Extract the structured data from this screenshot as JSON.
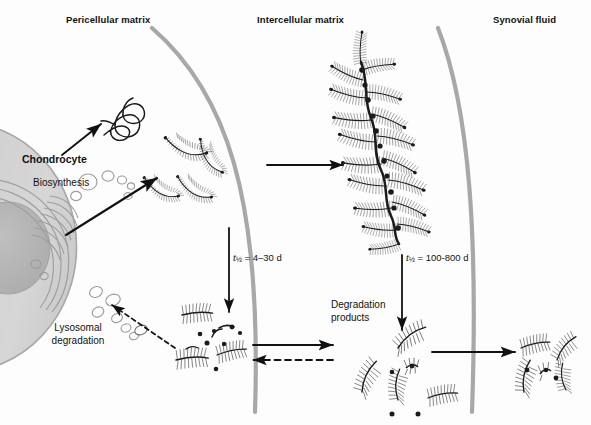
{
  "figure": {
    "background": "#fdfdfd",
    "width": 591,
    "height": 425
  },
  "zones": [
    {
      "id": "pericellular",
      "label": "Pericellular matrix",
      "x": 66,
      "y": 14
    },
    {
      "id": "intercellular",
      "label": "Intercellular matrix",
      "x": 257,
      "y": 14
    },
    {
      "id": "synovial",
      "label": "Synovial fluid",
      "x": 493,
      "y": 14
    }
  ],
  "boundaries": [
    {
      "id": "pericellular-intercellular-boundary",
      "color": "#a8a8a8",
      "width": 4.2
    },
    {
      "id": "intercellular-synovial-boundary",
      "color": "#a8a8a8",
      "width": 4.2
    }
  ],
  "cell": {
    "name": "Chondrocyte",
    "label": "Chondrocyte",
    "label_x": 22,
    "label_y": 153,
    "fill": "#d3d3d3",
    "nucleus_fill": "#b4b4b4",
    "organelle_stroke": "#9a9a9a",
    "processes": [
      {
        "id": "biosynthesis",
        "label": "Biosynthesis",
        "x": 33,
        "y": 177
      },
      {
        "id": "lysosomal-degradation",
        "label": "Lysosomal\ndegradation",
        "line1": "Lysosomal",
        "line2": "degradation",
        "x": 30,
        "y": 328
      }
    ]
  },
  "annotations": {
    "halflife_aggrecan": {
      "id": "halflife-monomer",
      "symbol": "t",
      "subscript": "½",
      "text": " = 4–30 d",
      "full": "t½ = 4–30 d",
      "x": 233,
      "y": 258
    },
    "halflife_aggregate": {
      "id": "halflife-aggregate",
      "symbol": "t",
      "subscript": "½",
      "text": " = 100-800 d",
      "full": "t½ = 100-800 d",
      "x": 406,
      "y": 258
    },
    "degradation_products": {
      "id": "degradation-products",
      "line1": "Degradation",
      "line2": "products",
      "x": 331,
      "y": 305
    }
  },
  "molecules": {
    "hyaluronan_free": {
      "id": "hyaluronan-chain",
      "count": 1,
      "stroke": "#1a1a1a"
    },
    "aggrecan_monomers_pericellular": {
      "id": "aggrecan-monomer",
      "count": 4,
      "stroke": "#1a1a1a"
    },
    "aggregate": {
      "id": "proteoglycan-aggregate",
      "arms": 18,
      "backbone_nodes": 11,
      "stroke": "#1a1a1a"
    },
    "fragments_pericellular": {
      "id": "degraded-fragment",
      "count": 4,
      "debris_dots": 9
    },
    "fragments_intercellular": {
      "id": "degraded-fragment",
      "count": 5,
      "debris_dots": 3
    },
    "fragments_synovial": {
      "id": "degraded-fragment",
      "count": 6,
      "debris_dots": 2
    }
  },
  "arrows": [
    {
      "id": "arrow-secretion-hyaluronan",
      "style": "solid",
      "from": "chondrocyte",
      "to": "hyaluronan-chain"
    },
    {
      "id": "arrow-secretion-aggrecan",
      "style": "solid",
      "from": "chondrocyte",
      "to": "aggrecan-monomers"
    },
    {
      "id": "arrow-aggregation",
      "style": "solid",
      "from": "aggrecan-monomers",
      "to": "proteoglycan-aggregate"
    },
    {
      "id": "arrow-monomer-degradation",
      "style": "solid",
      "from": "aggrecan-monomers",
      "to": "fragments-pericellular"
    },
    {
      "id": "arrow-aggregate-degradation",
      "style": "solid",
      "from": "proteoglycan-aggregate",
      "to": "fragments-intercellular"
    },
    {
      "id": "arrow-fragments-outward",
      "style": "solid",
      "from": "fragments-pericellular",
      "to": "fragments-intercellular"
    },
    {
      "id": "arrow-fragments-inward",
      "style": "dashed",
      "from": "fragments-intercellular",
      "to": "fragments-pericellular"
    },
    {
      "id": "arrow-fragments-to-synovial",
      "style": "solid",
      "from": "fragments-intercellular",
      "to": "fragments-synovial"
    },
    {
      "id": "arrow-endocytosis",
      "style": "dashed",
      "from": "fragments-pericellular",
      "to": "lysosome"
    }
  ]
}
